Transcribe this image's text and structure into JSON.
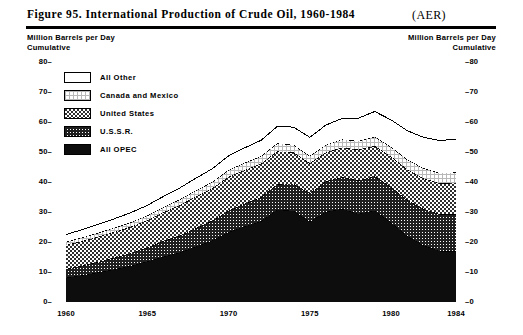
{
  "header": {
    "figure_title": "Figure 95.  International Production of Crude Oil, 1960-1984",
    "source_tag": "(AER)"
  },
  "axis_captions": {
    "left_line1": "Million Barrels per Day",
    "left_line2": "Cumulative",
    "right_line1": "Million Barrels per Day",
    "right_line2": "Cumulative"
  },
  "legend": {
    "items": [
      {
        "label": "All Other",
        "pattern": "blank",
        "color": "#ffffff"
      },
      {
        "label": "Canada and Mexico",
        "pattern": "fine-grid",
        "color": "#e8e8e8"
      },
      {
        "label": "United States",
        "pattern": "checker",
        "color": "#6a6a6a"
      },
      {
        "label": "U.S.S.R.",
        "pattern": "dense-grid",
        "color": "#3c3c3c"
      },
      {
        "label": "All OPEC",
        "pattern": "solid",
        "color": "#0d0d0d"
      }
    ]
  },
  "chart_data": {
    "type": "area",
    "title": "Figure 95.  International Production of Crude Oil, 1960-1984",
    "subtitle": "",
    "xlabel": "",
    "ylabel": "Million Barrels per Day Cumulative",
    "stacked": true,
    "grid": false,
    "legend_position": "inside-top-left",
    "xlim": [
      1960,
      1984
    ],
    "ylim": [
      0,
      80
    ],
    "ytick_labels": [
      "0",
      "10",
      "20",
      "30",
      "40",
      "50",
      "60",
      "70",
      "80"
    ],
    "yticks": [
      0,
      10,
      20,
      30,
      40,
      50,
      60,
      70,
      80
    ],
    "xtick_labels": [
      "1960",
      "1965",
      "1970",
      "1975",
      "1980",
      "1984"
    ],
    "xticks": [
      1960,
      1965,
      1970,
      1975,
      1980,
      1984
    ],
    "x": [
      1960,
      1961,
      1962,
      1963,
      1964,
      1965,
      1966,
      1967,
      1968,
      1969,
      1970,
      1971,
      1972,
      1973,
      1974,
      1975,
      1976,
      1977,
      1978,
      1979,
      1980,
      1981,
      1982,
      1983,
      1984
    ],
    "series": [
      {
        "name": "All OPEC",
        "values": [
          8.1,
          8.9,
          9.9,
          10.9,
          12.1,
          13.5,
          15.1,
          16.5,
          18.5,
          20.5,
          23.3,
          25.2,
          26.9,
          30.8,
          30.4,
          26.8,
          30.1,
          31.0,
          29.4,
          30.5,
          26.5,
          22.0,
          18.9,
          17.0,
          17.0
        ]
      },
      {
        "name": "U.S.S.R.",
        "values": [
          2.9,
          3.2,
          3.5,
          3.9,
          4.2,
          4.7,
          5.2,
          5.6,
          6.1,
          6.6,
          7.1,
          7.6,
          8.0,
          8.5,
          9.0,
          9.5,
          10.1,
          10.6,
          11.1,
          11.4,
          11.8,
          12.0,
          12.1,
          12.3,
          12.2
        ]
      },
      {
        "name": "United States",
        "values": [
          8.0,
          8.2,
          8.4,
          8.6,
          8.8,
          9.0,
          9.6,
          10.2,
          10.6,
          10.8,
          11.3,
          11.2,
          11.2,
          10.9,
          10.5,
          10.0,
          9.7,
          9.9,
          10.3,
          10.1,
          10.2,
          10.2,
          10.2,
          10.3,
          10.5
        ]
      },
      {
        "name": "Canada and Mexico",
        "values": [
          1.1,
          1.2,
          1.3,
          1.4,
          1.5,
          1.6,
          1.7,
          1.9,
          2.0,
          2.1,
          2.3,
          2.4,
          2.5,
          2.7,
          2.5,
          2.4,
          2.5,
          2.7,
          2.9,
          3.1,
          3.2,
          3.3,
          3.4,
          3.4,
          3.5
        ]
      },
      {
        "name": "All Other",
        "values": [
          2.4,
          2.6,
          2.8,
          3.0,
          3.2,
          3.4,
          3.6,
          3.8,
          4.1,
          4.4,
          4.7,
          5.0,
          5.3,
          5.6,
          5.9,
          6.2,
          6.6,
          7.0,
          7.6,
          8.4,
          9.0,
          9.6,
          10.3,
          10.8,
          11.1
        ]
      }
    ],
    "totals": [
      22.5,
      24.1,
      25.9,
      27.8,
      29.8,
      32.2,
      35.2,
      38.0,
      41.3,
      44.4,
      48.7,
      51.4,
      53.9,
      58.5,
      58.3,
      54.9,
      59.0,
      61.2,
      61.3,
      63.5,
      60.7,
      57.1,
      54.9,
      53.8,
      54.3
    ]
  }
}
